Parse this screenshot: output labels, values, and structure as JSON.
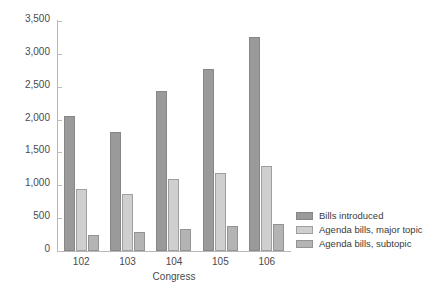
{
  "chart_data": {
    "type": "bar",
    "title": "",
    "xlabel": "Congress",
    "ylabel": "",
    "categories": [
      "102",
      "103",
      "104",
      "105",
      "106"
    ],
    "ylim": [
      0,
      3500
    ],
    "yticks": [
      0,
      500,
      1000,
      1500,
      2000,
      2500,
      3000,
      3500
    ],
    "ytick_labels": [
      "0",
      "500",
      "1,000",
      "1,500",
      "2,000",
      "2,500",
      "3,000",
      "3,500"
    ],
    "grid": false,
    "legend_position": "right",
    "series": [
      {
        "name": "Bills introduced",
        "color": "#9a9a9a",
        "values": [
          2050,
          1810,
          2440,
          2770,
          3250
        ]
      },
      {
        "name": "Agenda bills, major topic",
        "color": "#cfcfcf",
        "values": [
          950,
          870,
          1100,
          1190,
          1300
        ]
      },
      {
        "name": "Agenda bills, subtopic",
        "color": "#b4b4b4",
        "values": [
          245,
          290,
          340,
          385,
          410
        ]
      }
    ]
  }
}
